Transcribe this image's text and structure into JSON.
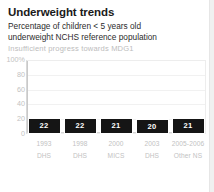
{
  "header": {
    "title": "Underweight trends",
    "subtitle_line1": "Percentage of children < 5 years old",
    "subtitle_line2": "underweight NCHS reference population",
    "status": "Insufficient progress towards MDG1"
  },
  "colors": {
    "bar": "#151515",
    "bar_label": "#ffffff",
    "axis_text": "#c2c2c2",
    "title_text": "#1a1a1a",
    "status_text": "#bdbdbd",
    "gridline": "#f1f1f1"
  },
  "chart_data": {
    "type": "bar",
    "title": "Underweight trends",
    "subtitle": "Percentage of children < 5 years old underweight NCHS reference population",
    "annotation": "Insufficient progress towards MDG1",
    "categories": [
      "1993",
      "1998",
      "2000",
      "2003",
      "2005-2006"
    ],
    "sources": [
      "DHS",
      "DHS",
      "MICS",
      "DHS",
      "Other NS"
    ],
    "values": [
      22,
      22,
      21,
      20,
      21
    ],
    "xlabel": "",
    "ylabel": "",
    "ylim": [
      0,
      100
    ],
    "yticks": [
      "100%",
      "80",
      "60",
      "40",
      "20",
      "0"
    ],
    "ytick_values": [
      100,
      80,
      60,
      40,
      20,
      0
    ],
    "grid": true,
    "legend": "none"
  }
}
